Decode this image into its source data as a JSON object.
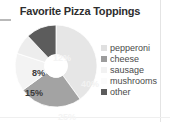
{
  "chart_data": {
    "type": "pie",
    "variant": "donut",
    "title": "Favorite Pizza Toppings",
    "xlabel": "",
    "ylabel": "",
    "categories": [
      "pepperoni",
      "cheese",
      "sausage",
      "mushrooms",
      "other"
    ],
    "values": [
      40,
      25,
      15,
      8,
      12
    ],
    "value_labels": [
      "40%",
      "25%",
      "15%",
      "8%",
      "12%"
    ],
    "units": "percent",
    "grid": false,
    "legend_position": "right",
    "start_angle_deg": 0,
    "direction": "clockwise",
    "inner_radius_ratio": 0.28,
    "slice_colors": [
      "#e6e6e6",
      "#a3a3a3",
      "#f3f3f3",
      "#ededed",
      "#5c5c5c"
    ],
    "slice_label_colors": [
      "#f2f2f2",
      "#f4f4f4",
      "#3a3a3a",
      "#3a3a3a",
      "#f4f4f4"
    ]
  },
  "title": {
    "text": "Favorite Pizza Toppings"
  },
  "slices": [
    {
      "name": "pepperoni",
      "percent_label": "40%",
      "color": "#e6e6e6"
    },
    {
      "name": "cheese",
      "percent_label": "25%",
      "color": "#a3a3a3"
    },
    {
      "name": "sausage",
      "percent_label": "15%",
      "color": "#f3f3f3"
    },
    {
      "name": "mushrooms",
      "percent_label": "8%",
      "color": "#ededed"
    },
    {
      "name": "other",
      "percent_label": "12%",
      "color": "#5c5c5c"
    }
  ],
  "legend": {
    "items": [
      {
        "label": "pepperoni",
        "color": "#e0e0e0"
      },
      {
        "label": "cheese",
        "color": "#9c9c9c"
      },
      {
        "label": "sausage",
        "color": "#f2f2f2"
      },
      {
        "label": "mushrooms",
        "color": "#fbfbfb"
      },
      {
        "label": "other",
        "color": "#5c5c5c"
      }
    ]
  }
}
